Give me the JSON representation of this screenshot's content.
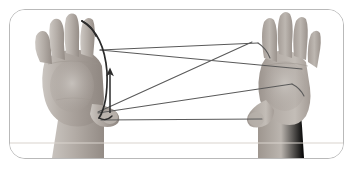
{
  "scene": {
    "title": "String figure demonstration photograph",
    "description": "Two human hands, palms facing the viewer, fingers spread, holding a loop of string stretched between them. A dark string loop is being lifted off the left index finger, indicated by an upward arrow.",
    "background_color": "#ffffff",
    "border_color": "#b9b9b9",
    "border_radius_px": 16,
    "frame": {
      "left": 9,
      "top": 9,
      "width": 335,
      "height": 150
    }
  },
  "elements": {
    "left_hand": {
      "label": "left hand",
      "orientation": "palm toward viewer, fingers pointing up and spread",
      "skin_tone": "#b9b2ac",
      "thumb_label": "left thumb",
      "anchor_point": {
        "x": 98,
        "y": 117
      }
    },
    "right_hand": {
      "label": "right hand",
      "orientation": "palm toward viewer, fingers pointing up and spread",
      "skin_tone": "#b4aeaa",
      "thumb_label": "right thumb",
      "anchor_point": {
        "x": 268,
        "y": 118
      }
    },
    "strings": {
      "label": "string loop",
      "color": "#5a5a5a",
      "count": 5,
      "segments": [
        {
          "name": "upper-front-string",
          "x1": 100,
          "y1": 50,
          "x2": 258,
          "y2": 43
        },
        {
          "name": "upper-back-string",
          "x1": 100,
          "y1": 50,
          "x2": 300,
          "y2": 68
        },
        {
          "name": "diagonal-string",
          "x1": 98,
          "y1": 112,
          "x2": 252,
          "y2": 42
        },
        {
          "name": "middle-string",
          "x1": 98,
          "y1": 113,
          "x2": 287,
          "y2": 83
        },
        {
          "name": "lower-string",
          "x1": 101,
          "y1": 120,
          "x2": 262,
          "y2": 119
        }
      ]
    },
    "moving_loop": {
      "label": "loop being lifted off index finger",
      "color": "#2b2b2b",
      "start": {
        "x": 82,
        "y": 21
      },
      "end": {
        "x": 99,
        "y": 118
      }
    },
    "arrow": {
      "label": "upward motion arrow",
      "color": "#2b2b2b",
      "direction": "up",
      "tail": {
        "x": 110,
        "y": 113
      },
      "head": {
        "x": 110,
        "y": 71
      }
    },
    "table_edge": {
      "label": "table edge line",
      "color": "#d9d4cd",
      "y": 143
    }
  }
}
